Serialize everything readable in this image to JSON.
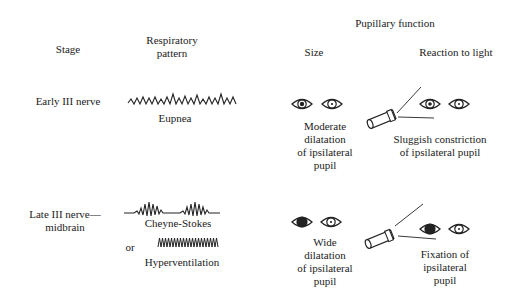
{
  "headers": {
    "stage": "Stage",
    "respiratory_line1": "Respiratory",
    "respiratory_line2": "pattern",
    "pupillary_function": "Pupillary function",
    "size": "Size",
    "reaction": "Reaction to light"
  },
  "rows": [
    {
      "stage": "Early III nerve",
      "respiratory": "Eupnea",
      "size_lines": [
        "Moderate",
        "dilatation",
        "of ipsilateral",
        "pupil"
      ],
      "reaction_lines": [
        "Sluggish constriction",
        "of ipsilateral pupil"
      ]
    },
    {
      "stage_lines": [
        "Late III nerve—",
        "midbrain"
      ],
      "respiratory": "Cheyne-Stokes",
      "or": "or",
      "respiratory_alt": "Hyperventilation",
      "size_lines": [
        "Wide",
        "dilatation",
        "of ipsilateral",
        "pupil"
      ],
      "reaction_lines": [
        "Fixation of",
        "ipsilateral",
        "pupil"
      ]
    }
  ],
  "icons": [
    "eye-icon",
    "flashlight-icon",
    "respiratory-waveform"
  ]
}
